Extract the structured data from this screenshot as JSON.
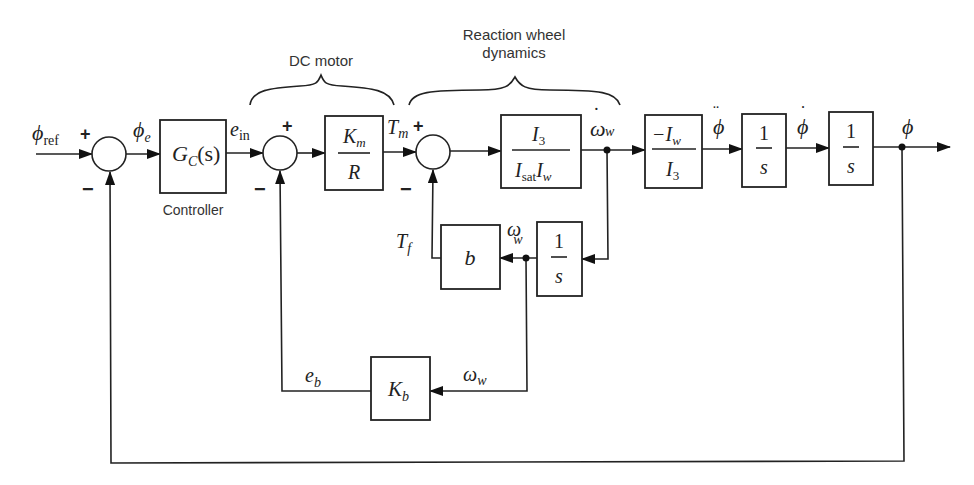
{
  "diagram": {
    "type": "block-diagram",
    "group_labels": {
      "dc_motor": "DC motor",
      "reaction_wheel_line1": "Reaction wheel",
      "reaction_wheel_line2": "dynamics"
    },
    "blocks": {
      "controller": {
        "label": "G",
        "sub": "C",
        "suffix": "(s)",
        "caption": "Controller"
      },
      "motor_gain": {
        "num": "K",
        "num_sub": "m",
        "den": "R"
      },
      "wheel_inertia": {
        "num": "I",
        "num_sub": "3",
        "den_a": "I",
        "den_a_sub": "sat",
        "den_b": "I",
        "den_b_sub": "w"
      },
      "body_coupling": {
        "num": "−I",
        "num_sub": "w",
        "den": "I",
        "den_sub": "3"
      },
      "integrator1": {
        "num": "1",
        "den": "s"
      },
      "integrator2": {
        "num": "1",
        "den": "s"
      },
      "wheel_integrator": {
        "num": "1",
        "den": "s"
      },
      "friction": {
        "label": "b"
      },
      "back_emf": {
        "label": "K",
        "sub": "b"
      }
    },
    "signals": {
      "phi_ref": {
        "sym": "ϕ",
        "sub": "ref"
      },
      "phi_e": {
        "sym": "ϕ",
        "sub": "e"
      },
      "e_in": {
        "sym": "e",
        "sub": "in"
      },
      "T_m": {
        "sym": "T",
        "sub": "m"
      },
      "T_f": {
        "sym": "T",
        "sub": "f"
      },
      "omega_w_dot": {
        "sym": "ω",
        "sub": "w",
        "accent": "˙"
      },
      "phi_ddot": {
        "sym": "ϕ",
        "accent": "¨"
      },
      "phi_dot": {
        "sym": "ϕ",
        "accent": "˙"
      },
      "phi": {
        "sym": "ϕ"
      },
      "omega_w_upper": {
        "sym": "ω",
        "sub": "w"
      },
      "omega_w_lower": {
        "sym": "ω",
        "sub": "w"
      },
      "e_b": {
        "sym": "e",
        "sub": "b"
      }
    },
    "signs": {
      "plus": "+",
      "minus": "−"
    }
  }
}
